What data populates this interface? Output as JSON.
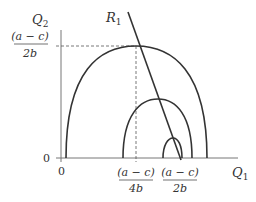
{
  "diagram": {
    "axes": {
      "y_label": "Q",
      "y_sub": "2",
      "x_label": "Q",
      "x_sub": "1",
      "origin_x_tick": "0",
      "origin_y_tick": "0"
    },
    "line_label": "R",
    "line_sub": "1",
    "y_marker": {
      "numerator": "(a − c)",
      "denominator": "2b"
    },
    "x_markers": [
      {
        "numerator": "(a − c)",
        "denominator": "4b"
      },
      {
        "numerator": "(a − c)",
        "denominator": "2b"
      }
    ],
    "colors": {
      "stroke": "#333333",
      "dashed": "#555555",
      "axis": "#777777"
    }
  }
}
